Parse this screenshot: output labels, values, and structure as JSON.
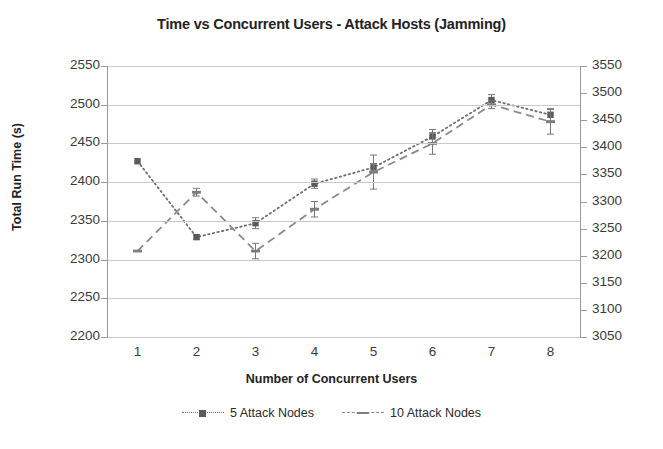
{
  "chart_data": {
    "type": "line",
    "title": "Time vs Concurrent Users - Attack Hosts (Jamming)",
    "xlabel": "Number of Concurrent Users",
    "ylabel": "Total Run Time (s)",
    "ylabel_secondary": "",
    "x": [
      1,
      2,
      3,
      4,
      5,
      6,
      7,
      8
    ],
    "xtick_labels": [
      "1",
      "2",
      "3",
      "4",
      "5",
      "6",
      "7",
      "8"
    ],
    "xlim": [
      0.5,
      8.5
    ],
    "ylim": [
      2200,
      2550
    ],
    "ytick_labels": [
      "2550",
      "2500",
      "2450",
      "2400",
      "2350",
      "2300",
      "2250",
      "2200"
    ],
    "yticks": [
      2550,
      2500,
      2450,
      2400,
      2350,
      2300,
      2250,
      2200
    ],
    "ylim_secondary": [
      3050,
      3550
    ],
    "ytick_labels_secondary": [
      "3550",
      "3500",
      "3450",
      "3400",
      "3350",
      "3300",
      "3250",
      "3200",
      "3150",
      "3100",
      "3050"
    ],
    "yticks_secondary": [
      3550,
      3500,
      3450,
      3400,
      3350,
      3300,
      3250,
      3200,
      3150,
      3100,
      3050
    ],
    "grid": true,
    "legend_position": "bottom",
    "series": [
      {
        "name": "5 Attack Nodes",
        "axis": "left",
        "style": "dotted",
        "marker": "square",
        "color": "#6f6f6f",
        "values": [
          2427,
          2329,
          2347,
          2398,
          2419,
          2459,
          2506,
          2487
        ],
        "errors": [
          0,
          3,
          7,
          6,
          5,
          9,
          7,
          8
        ]
      },
      {
        "name": "10 Attack Nodes",
        "axis": "right",
        "style": "dashed",
        "marker": "dash",
        "color": "#8a8a8a",
        "values": [
          3211,
          3288,
          3211,
          3265,
          3313,
          3350,
          3400,
          3378
        ],
        "values_left_scale": [
          2311,
          2387,
          2311,
          2365,
          2413,
          2450,
          2500,
          2478
        ],
        "errors": [
          0,
          5,
          10,
          10,
          22,
          14,
          5,
          16
        ]
      }
    ]
  },
  "legend": {
    "items": [
      {
        "label": "5 Attack Nodes"
      },
      {
        "label": "10 Attack Nodes"
      }
    ]
  }
}
